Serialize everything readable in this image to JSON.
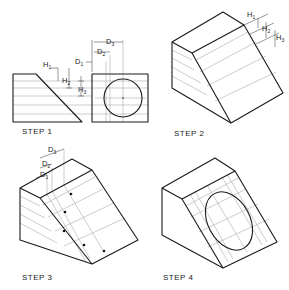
{
  "figure": {
    "steps": [
      {
        "id": 1,
        "label": "STEP 1",
        "description": "Orthographic side and front views with H and D offset measurements"
      },
      {
        "id": 2,
        "label": "STEP 2",
        "description": "Isometric block with H1, H2, H3 transferred to inclined face"
      },
      {
        "id": 3,
        "label": "STEP 3",
        "description": "D1, D2, D3 transferred; points plotted on inclined face"
      },
      {
        "id": 4,
        "label": "STEP 4",
        "description": "Ellipse drawn through plotted points"
      }
    ],
    "dimensions": {
      "h1": "H",
      "h1_sub": "1",
      "h2": "H",
      "h2_sub": "2",
      "h3": "H",
      "h3_sub": "3",
      "d1": "D",
      "d1_sub": "1",
      "d2": "D",
      "d2_sub": "2",
      "d3": "D",
      "d3_sub": "3"
    },
    "colors": {
      "line": "#1a1a1a",
      "construction": "#9a9a9a",
      "background": "#ffffff"
    }
  }
}
